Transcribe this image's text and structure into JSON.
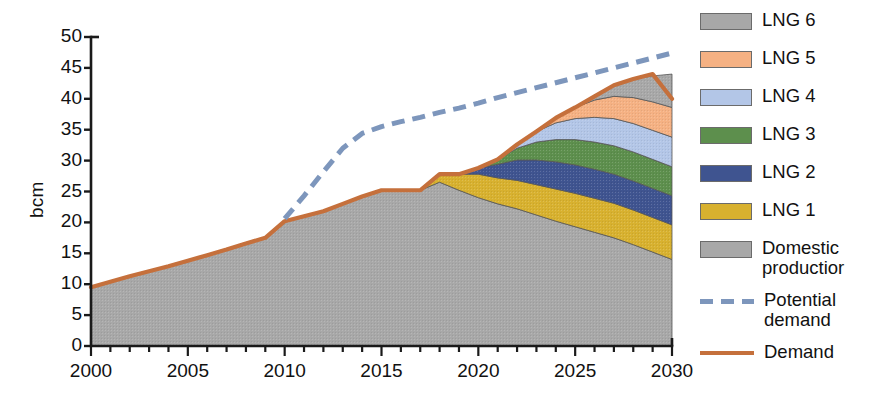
{
  "chart_data": {
    "type": "area",
    "title": "",
    "xlabel": "",
    "ylabel": "bcm",
    "xlim": [
      2000,
      2030
    ],
    "ylim": [
      0,
      50
    ],
    "ytick_step": 5,
    "yticks": [
      0,
      5,
      10,
      15,
      20,
      25,
      30,
      35,
      40,
      45,
      50
    ],
    "xticks": [
      2000,
      2005,
      2010,
      2015,
      2020,
      2025,
      2030
    ],
    "xtick_minor_step": 1,
    "grid": false,
    "legend_position": "right",
    "stack_order_bottom_to_top": [
      "Domestic production",
      "LNG 1",
      "LNG 2",
      "LNG 3",
      "LNG 4",
      "LNG 5",
      "LNG 6"
    ],
    "x": [
      2000,
      2001,
      2002,
      2003,
      2004,
      2005,
      2006,
      2007,
      2008,
      2009,
      2010,
      2011,
      2012,
      2013,
      2014,
      2015,
      2016,
      2017,
      2018,
      2019,
      2020,
      2021,
      2022,
      2023,
      2024,
      2025,
      2026,
      2027,
      2028,
      2029,
      2030
    ],
    "series": [
      {
        "name": "Domestic production",
        "color": "#a8a8a8",
        "values": [
          9.5,
          10.4,
          11.3,
          12.1,
          12.9,
          13.8,
          14.7,
          15.6,
          16.6,
          17.5,
          20.2,
          21.0,
          21.8,
          23.0,
          24.2,
          25.2,
          25.2,
          25.2,
          26.5,
          25.2,
          24.0,
          23.0,
          22.2,
          21.2,
          20.2,
          19.3,
          18.4,
          17.5,
          16.4,
          15.2,
          14.0
        ]
      },
      {
        "name": "LNG 1",
        "color": "#d8b12f",
        "values": [
          0,
          0,
          0,
          0,
          0,
          0,
          0,
          0,
          0,
          0,
          0,
          0,
          0,
          0,
          0,
          0,
          0,
          0,
          1.3,
          2.6,
          3.8,
          4.2,
          4.6,
          4.9,
          5.2,
          5.4,
          5.5,
          5.6,
          5.6,
          5.6,
          5.6
        ]
      },
      {
        "name": "LNG 2",
        "color": "#3f5490",
        "values": [
          0,
          0,
          0,
          0,
          0,
          0,
          0,
          0,
          0,
          0,
          0,
          0,
          0,
          0,
          0,
          0,
          0,
          0,
          0,
          0,
          1.0,
          2.2,
          3.3,
          4.0,
          4.4,
          4.6,
          4.7,
          4.7,
          4.7,
          4.7,
          4.7
        ]
      },
      {
        "name": "LNG 3",
        "color": "#5d8f4d",
        "values": [
          0,
          0,
          0,
          0,
          0,
          0,
          0,
          0,
          0,
          0,
          0,
          0,
          0,
          0,
          0,
          0,
          0,
          0,
          0,
          0,
          0,
          0.8,
          1.9,
          2.9,
          3.6,
          4.1,
          4.4,
          4.6,
          4.7,
          4.7,
          4.7
        ]
      },
      {
        "name": "LNG 4",
        "color": "#b3c6e7",
        "values": [
          0,
          0,
          0,
          0,
          0,
          0,
          0,
          0,
          0,
          0,
          0,
          0,
          0,
          0,
          0,
          0,
          0,
          0,
          0,
          0,
          0,
          0,
          0.6,
          1.7,
          2.7,
          3.4,
          4.0,
          4.4,
          4.6,
          4.7,
          4.8
        ]
      },
      {
        "name": "LNG 5",
        "color": "#f5b183",
        "values": [
          0,
          0,
          0,
          0,
          0,
          0,
          0,
          0,
          0,
          0,
          0,
          0,
          0,
          0,
          0,
          0,
          0,
          0,
          0,
          0,
          0,
          0,
          0,
          0,
          0.8,
          1.8,
          2.8,
          3.6,
          4.2,
          4.6,
          4.8
        ]
      },
      {
        "name": "LNG 6",
        "color": "#a8a8a8",
        "values": [
          0,
          0,
          0,
          0,
          0,
          0,
          0,
          0,
          0,
          0,
          0,
          0,
          0,
          0,
          0,
          0,
          0,
          0,
          0,
          0,
          0,
          0,
          0,
          0,
          0,
          0,
          0.6,
          1.8,
          3.0,
          4.2,
          5.4
        ]
      }
    ],
    "lines": [
      {
        "name": "Demand",
        "color": "#c5703c",
        "style": "solid",
        "values": [
          9.5,
          10.4,
          11.3,
          12.1,
          12.9,
          13.8,
          14.7,
          15.6,
          16.6,
          17.5,
          20.2,
          21.0,
          21.8,
          23.0,
          24.2,
          25.2,
          25.2,
          25.2,
          27.8,
          27.8,
          28.8,
          30.2,
          32.6,
          34.7,
          36.9,
          38.6,
          40.4,
          42.2,
          43.2,
          44.0,
          40.0
        ]
      },
      {
        "name": "Potential demand",
        "color": "#7d96bc",
        "style": "dashed",
        "values": [
          null,
          null,
          null,
          null,
          null,
          null,
          null,
          null,
          null,
          null,
          20.6,
          24.3,
          28.2,
          32.0,
          34.4,
          35.5,
          36.3,
          37.0,
          37.8,
          38.5,
          39.3,
          40.2,
          41.0,
          41.8,
          42.6,
          43.4,
          44.2,
          45.0,
          45.8,
          46.6,
          47.4
        ]
      }
    ]
  },
  "axis": {
    "ylabel": "bcm",
    "ytick_labels": [
      "50",
      "45",
      "40",
      "35",
      "30",
      "25",
      "20",
      "15",
      "10",
      "5",
      "0"
    ],
    "xtick_labels": [
      "2000",
      "2005",
      "2010",
      "2015",
      "2020",
      "2025",
      "2030"
    ]
  },
  "legend": {
    "items": [
      {
        "label": "LNG 6",
        "type": "swatch",
        "color": "#a8a8a8",
        "tall": false
      },
      {
        "label": "LNG 5",
        "type": "swatch",
        "color": "#f5b183",
        "tall": false
      },
      {
        "label": "LNG 4",
        "type": "swatch",
        "color": "#b3c6e7",
        "tall": false
      },
      {
        "label": "LNG 3",
        "type": "swatch",
        "color": "#5d8f4d",
        "tall": false
      },
      {
        "label": "LNG 2",
        "type": "swatch",
        "color": "#3f5490",
        "tall": false
      },
      {
        "label": "LNG 1",
        "type": "swatch",
        "color": "#d8b12f",
        "tall": false
      },
      {
        "label": "Domestic\nproductior",
        "type": "swatch",
        "color": "#a8a8a8",
        "tall": true
      },
      {
        "label": "Potential\ndemand",
        "type": "dashed",
        "color": "#7d96bc",
        "tall": true
      },
      {
        "label": "Demand",
        "type": "solid",
        "color": "#c5703c",
        "tall": false
      }
    ]
  }
}
